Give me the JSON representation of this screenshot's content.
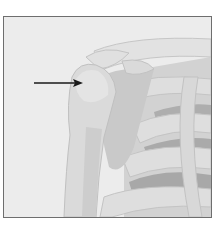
{
  "figure": {
    "annotation": {
      "type": "arrow",
      "target": "humeral-head",
      "color": "#1a1a1a"
    },
    "colors": {
      "background": "#ececec",
      "bone_light": "#dcdcdc",
      "bone_mid": "#cfcfcf",
      "bone_dark": "#b9b9b9",
      "muscle": "#a9a9a9",
      "border": "#6e6e6e"
    }
  }
}
